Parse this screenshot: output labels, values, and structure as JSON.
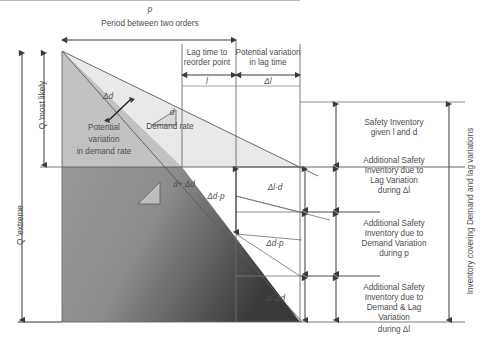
{
  "figure": {
    "colors": {
      "text": "#4d4d4d",
      "line": "#595959",
      "light_band": "#e6e6e6",
      "mid_band": "#c9c9c9",
      "dark_band": "#8c8c8c",
      "darkest_band": "#4a4a4a",
      "background": "#ffffff"
    },
    "top": {
      "period_symbol": "p",
      "period_label": "Period between two orders",
      "lag_label_line1": "Lag time to",
      "lag_label_line2": "reorder point",
      "lag_symbol": "l",
      "lagvar_label_line1": "Potential variation",
      "lagvar_label_line2": "in lag time",
      "lagvar_symbol": "Δl"
    },
    "left_axis": {
      "q_most_likely": "Q 'most likely",
      "q_extreme": "Q 'extreme"
    },
    "plot_labels": {
      "delta_d": "Δd",
      "demand_rate_symbol": "d",
      "demand_rate_label": "Demand rate",
      "demand_plus_delta": "d+ Δd",
      "potential_variation_line1": "Potential",
      "potential_variation_line2": "variation",
      "potential_variation_line3": "in demand rate",
      "delta_d_p_inner": "Δd·p"
    },
    "brackets": [
      {
        "symbol": "Δl·d"
      },
      {
        "symbol": "Δd·p"
      },
      {
        "symbol": "Δl·Δd"
      }
    ],
    "right_legend": [
      {
        "lines": [
          "Safety Inventory",
          "given l and d"
        ]
      },
      {
        "lines": [
          "Additional Safety",
          "Inventory due to",
          "Lag Variation",
          "during Δl"
        ]
      },
      {
        "lines": [
          "Additional Safety",
          "Inventory due to",
          "Demand Variation",
          "during p"
        ]
      },
      {
        "lines": [
          "Additional Safety",
          "Inventory due to",
          "Demand & Lag",
          "Variation",
          "during Δl"
        ]
      }
    ],
    "right_axis": {
      "label": "Inventory covering Demand and lag variations"
    }
  }
}
